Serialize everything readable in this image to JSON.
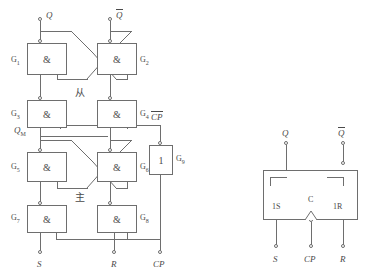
{
  "figure": {
    "title_visible": false,
    "stroke_color": "#6e6e6e",
    "text_color": "#4a4a4a",
    "background": "#ffffff"
  },
  "circuit": {
    "name": "master-slave-rs-flip-flop-gate-level",
    "nand_symbol": "&",
    "inverter_symbol": "1",
    "gates": [
      {
        "id": "G1",
        "label": "G",
        "sub": "1",
        "symbol": "&"
      },
      {
        "id": "G2",
        "label": "G",
        "sub": "2",
        "symbol": "&"
      },
      {
        "id": "G3",
        "label": "G",
        "sub": "3",
        "symbol": "&"
      },
      {
        "id": "G4",
        "label": "G",
        "sub": "4",
        "symbol": "&"
      },
      {
        "id": "G5",
        "label": "G",
        "sub": "5",
        "symbol": "&"
      },
      {
        "id": "G6",
        "label": "G",
        "sub": "6",
        "symbol": "&"
      },
      {
        "id": "G7",
        "label": "G",
        "sub": "7",
        "symbol": "&"
      },
      {
        "id": "G8",
        "label": "G",
        "sub": "8",
        "symbol": "&"
      },
      {
        "id": "G9",
        "label": "G",
        "sub": "9",
        "symbol": "1"
      }
    ],
    "labels": {
      "q_out": "Q",
      "qbar_out": "Q",
      "qm": "Q",
      "qm_sub": "M",
      "cp_bar": "CP",
      "s_in": "S",
      "r_in": "R",
      "cp_in": "CP",
      "slave_cn": "从",
      "master_cn": "主"
    }
  },
  "symbol": {
    "name": "rs-flip-flop-logic-symbol",
    "outputs": [
      {
        "id": "q",
        "label": "Q",
        "overbar": false
      },
      {
        "id": "qbar",
        "label": "Q",
        "overbar": true
      }
    ],
    "inputs": [
      {
        "id": "set",
        "pin": "1S",
        "terminal": "S"
      },
      {
        "id": "clock",
        "pin": "C",
        "terminal": "CP"
      },
      {
        "id": "reset",
        "pin": "1R",
        "terminal": "R"
      }
    ]
  }
}
